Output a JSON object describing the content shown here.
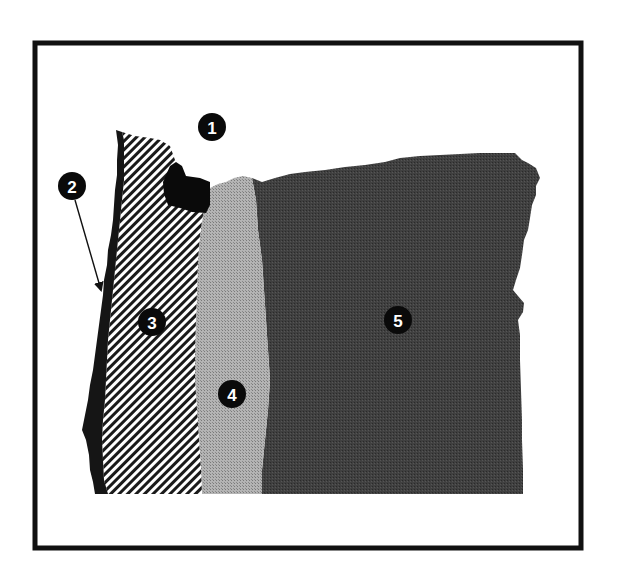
{
  "figure": {
    "frame_color": "#111111",
    "background": "#ffffff"
  },
  "regions": [
    {
      "id": 1,
      "label": "1",
      "fill": "#0a0a0a",
      "pattern": "solid-black"
    },
    {
      "id": 2,
      "label": "2",
      "fill": "#151515",
      "pattern": "solid-black-coastal-strip"
    },
    {
      "id": 3,
      "label": "3",
      "fill": "#ffffff",
      "pattern": "diagonal-hatch"
    },
    {
      "id": 4,
      "label": "4",
      "fill": "#a6a6a6",
      "pattern": "light-gray-stipple"
    },
    {
      "id": 5,
      "label": "5",
      "fill": "#3d3d3d",
      "pattern": "dark-gray-stipple"
    }
  ],
  "markers": [
    {
      "label": "1",
      "cx": 212,
      "cy": 127
    },
    {
      "label": "2",
      "cx": 72,
      "cy": 186
    },
    {
      "label": "3",
      "cx": 152,
      "cy": 322
    },
    {
      "label": "4",
      "cx": 232,
      "cy": 394
    },
    {
      "label": "5",
      "cx": 398,
      "cy": 320
    }
  ],
  "arrow": {
    "from_marker": "2",
    "to": [
      102,
      292
    ]
  }
}
